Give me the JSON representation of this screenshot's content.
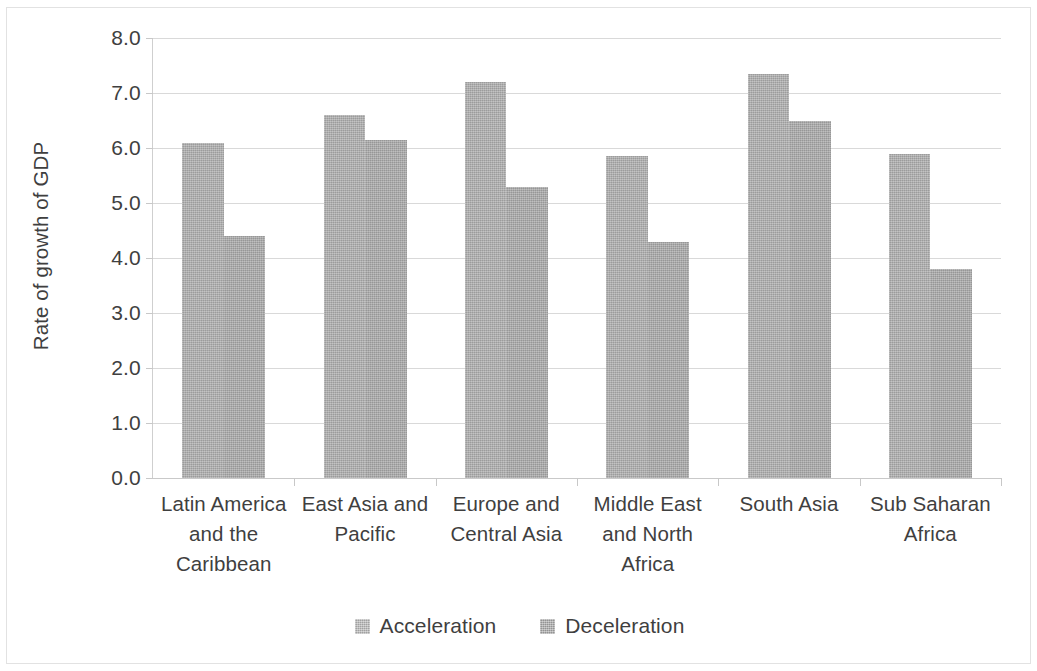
{
  "chart_data": {
    "type": "bar",
    "title": "",
    "xlabel": "",
    "ylabel": "Rate of growth of GDP",
    "ylim": [
      0.0,
      8.0
    ],
    "ytick_step": 1.0,
    "ytick_labels": [
      "8.0",
      "7.0",
      "6.0",
      "5.0",
      "4.0",
      "3.0",
      "2.0",
      "1.0",
      "0.0"
    ],
    "ytick_values": [
      8.0,
      7.0,
      6.0,
      5.0,
      4.0,
      3.0,
      2.0,
      1.0,
      0.0
    ],
    "grid": true,
    "legend_position": "bottom",
    "categories": [
      "Latin America and the Caribbean",
      "East Asia and Pacific",
      "Europe and Central Asia",
      "Middle East and North Africa",
      "South Asia",
      "Sub Saharan Africa"
    ],
    "category_label_lines": [
      [
        "Latin America",
        "and the",
        "Caribbean"
      ],
      [
        "East Asia and",
        "Pacific"
      ],
      [
        "Europe and",
        "Central Asia"
      ],
      [
        "Middle East",
        "and North",
        "Africa"
      ],
      [
        "South Asia"
      ],
      [
        "Sub Saharan",
        "Africa"
      ]
    ],
    "series": [
      {
        "name": "Acceleration",
        "color": "#ababab",
        "values": [
          6.1,
          6.6,
          7.2,
          5.85,
          7.35,
          5.9
        ]
      },
      {
        "name": "Deceleration",
        "color": "#a6a6a6",
        "values": [
          4.4,
          6.15,
          5.3,
          4.3,
          6.5,
          3.8
        ]
      }
    ]
  },
  "legend": {
    "entries": [
      {
        "label": "Acceleration"
      },
      {
        "label": "Deceleration"
      }
    ]
  },
  "axis": {
    "y_title": "Rate of growth of GDP"
  }
}
